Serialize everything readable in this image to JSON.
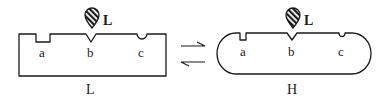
{
  "diagram": {
    "type": "conformational-equilibrium",
    "states": [
      {
        "id": "L",
        "label": "L",
        "shape": "rectangle",
        "sites": [
          {
            "label": "a",
            "notch": "rectangular"
          },
          {
            "label": "b",
            "notch": "v-shaped"
          },
          {
            "label": "c",
            "notch": "rounded"
          }
        ],
        "ligand": {
          "label": "L",
          "icon": "hatched-teardrop-icon"
        }
      },
      {
        "id": "H",
        "label": "H",
        "shape": "rounded-capsule",
        "sites": [
          {
            "label": "a",
            "notch": "narrow-rectangular"
          },
          {
            "label": "b",
            "notch": "v-shaped"
          },
          {
            "label": "c",
            "notch": "narrow-rounded"
          }
        ],
        "ligand": {
          "label": "L",
          "icon": "hatched-teardrop-icon"
        }
      }
    ],
    "equilibrium": {
      "forward": "L to H",
      "reverse": "H to L",
      "icon": "equilibrium-harpoons-icon"
    },
    "colors": {
      "stroke": "#1a1a1a",
      "background": "#ffffff"
    }
  }
}
